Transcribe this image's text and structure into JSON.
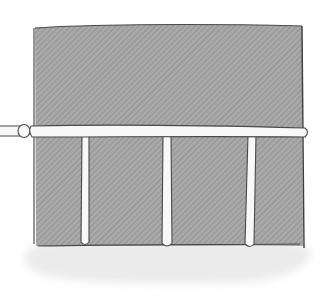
{
  "illustration": {
    "description": "Hand-drawn sketch of a gray crosshatched panel with a horizontal white rod across it and three vertical white poles, casting a light shadow",
    "colors": {
      "background": "#ffffff",
      "panel_fill": "#a8a8a8",
      "panel_hatch": "#8a8a8a",
      "outline": "#4a4a4a",
      "rod": "#f7f7f7",
      "shadow": "#e8e8e8"
    },
    "elements": {
      "panel": {
        "x": 34,
        "y": 24,
        "width": 270,
        "height": 222
      },
      "horizontal_rod": {
        "y": 130,
        "x_start": 0,
        "x_end": 307
      },
      "vertical_poles": [
        {
          "x": 86
        },
        {
          "x": 168
        },
        {
          "x": 250
        }
      ]
    }
  }
}
